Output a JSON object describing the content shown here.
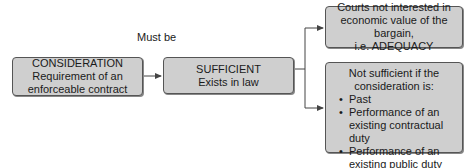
{
  "diagram": {
    "nodes": {
      "consideration": {
        "title": "CONSIDERATION",
        "lines": [
          "Requirement of an",
          "enforceable contract"
        ]
      },
      "sufficient": {
        "title": "SUFFICIENT",
        "lines": [
          "Exists in law"
        ]
      },
      "adequacy": {
        "lines": [
          "Courts not interested in",
          "economic value of the bargain,",
          "i.e. ADEQUACY"
        ]
      },
      "not_sufficient": {
        "lines": [
          "Not sufficient  if the",
          "consideration is:"
        ],
        "bullets": [
          "Past",
          "Performance of an existing contractual duty",
          "Performance of an existing public duty"
        ]
      }
    },
    "edges": [
      {
        "from": "consideration",
        "to": "sufficient",
        "label": "Must be"
      },
      {
        "from": "sufficient",
        "to": "adequacy",
        "label": ""
      },
      {
        "from": "sufficient",
        "to": "not_sufficient",
        "label": ""
      }
    ],
    "colors": {
      "box_fill": "#cfcfcf",
      "box_border": "#555555",
      "line": "#444444"
    }
  }
}
